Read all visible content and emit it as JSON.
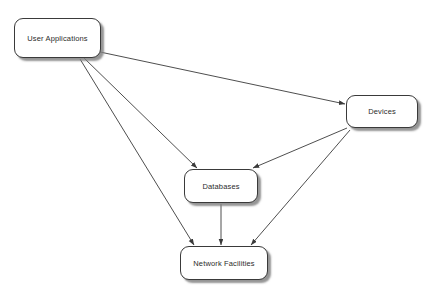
{
  "diagram": {
    "background_color": "#ffffff",
    "node_fill_color": "#ffffff",
    "node_border_color": "#3a3a3a",
    "node_shadow_color": "#828282",
    "edge_color": "#3a3a3a",
    "text_color": "#2b2b2b",
    "nodes": [
      {
        "id": "user-applications",
        "label": "User Applications",
        "x": 14,
        "y": 18,
        "width": 87,
        "height": 40
      },
      {
        "id": "devices",
        "label": "Devices",
        "x": 346,
        "y": 95,
        "width": 72,
        "height": 33
      },
      {
        "id": "databases",
        "label": "Databases",
        "x": 184,
        "y": 169,
        "width": 74,
        "height": 34
      },
      {
        "id": "network-facilities",
        "label": "Network Facilities",
        "x": 180,
        "y": 246,
        "width": 88,
        "height": 34
      }
    ],
    "edges": [
      {
        "id": "edge-user-applications-to-devices",
        "from": "User Applications",
        "to": "Devices",
        "from_x": 100,
        "from_y": 52,
        "to_x": 345,
        "to_y": 104,
        "directed": true
      },
      {
        "id": "edge-user-applications-to-databases",
        "from": "User Applications",
        "to": "Databases",
        "from_x": 84,
        "from_y": 58,
        "to_x": 197,
        "to_y": 168,
        "directed": true
      },
      {
        "id": "edge-user-applications-to-network-facilities",
        "from": "User Applications",
        "to": "Network Facilities",
        "from_x": 80,
        "from_y": 59,
        "to_x": 194,
        "to_y": 245,
        "directed": true
      },
      {
        "id": "edge-devices-to-databases",
        "from": "Devices",
        "to": "Databases",
        "from_x": 347,
        "from_y": 128,
        "to_x": 253,
        "to_y": 168,
        "directed": true
      },
      {
        "id": "edge-devices-to-network-facilities",
        "from": "Devices",
        "to": "Network Facilities",
        "from_x": 350,
        "from_y": 130,
        "to_x": 251,
        "to_y": 245,
        "directed": true
      },
      {
        "id": "edge-databases-to-network-facilities",
        "from": "Databases",
        "to": "Network Facilities",
        "from_x": 221,
        "from_y": 204,
        "to_x": 221,
        "to_y": 245,
        "directed": true
      }
    ]
  }
}
